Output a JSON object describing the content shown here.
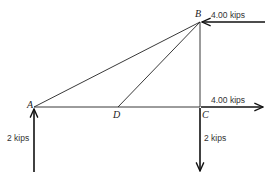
{
  "diagram": {
    "type": "truss-free-body",
    "nodes": {
      "A": {
        "label": "A",
        "x": 34,
        "y": 107
      },
      "B": {
        "label": "B",
        "x": 200,
        "y": 22
      },
      "C": {
        "label": "C",
        "x": 200,
        "y": 107
      },
      "D": {
        "label": "D",
        "x": 118,
        "y": 107
      }
    },
    "members": [
      {
        "from": "A",
        "to": "B"
      },
      {
        "from": "D",
        "to": "B"
      },
      {
        "from": "B",
        "to": "C"
      },
      {
        "from": "A",
        "to": "C"
      }
    ],
    "loads": [
      {
        "id": "load-b",
        "node": "B",
        "label": "4.00 kips",
        "direction": "left"
      },
      {
        "id": "load-c-horizontal",
        "node": "C",
        "label": "4.00 kips",
        "direction": "right"
      },
      {
        "id": "reaction-a",
        "node": "A",
        "label": "2 kips",
        "direction": "up"
      },
      {
        "id": "load-c-vertical",
        "node": "C",
        "label": "2 kips",
        "direction": "down"
      }
    ],
    "colors": {
      "line": "#222222",
      "background": "#ffffff"
    }
  }
}
